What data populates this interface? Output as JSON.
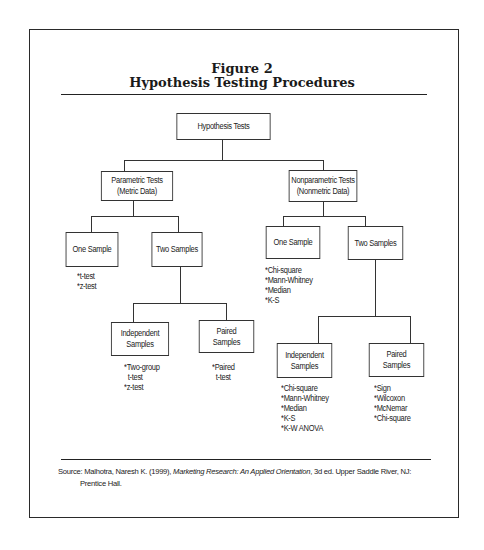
{
  "figure": {
    "label": "Figure 2",
    "title": "Hypothesis Testing Procedures"
  },
  "tree": {
    "root": "Hypothesis Tests",
    "parametric": {
      "label_line1": "Parametric Tests",
      "label_line2": "(Metric Data)",
      "one_sample": {
        "label": "One Sample",
        "tests": [
          "*t-test",
          "*z-test"
        ]
      },
      "two_samples": {
        "label": "Two Samples",
        "independent": {
          "label_line1": "Independent",
          "label_line2": "Samples",
          "tests": [
            "*Two-group",
            "  t-test",
            "*z-test"
          ]
        },
        "paired": {
          "label_line1": "Paired",
          "label_line2": "Samples",
          "tests": [
            "*Paired",
            "  t-test"
          ]
        }
      }
    },
    "nonparametric": {
      "label_line1": "Nonparametric Tests",
      "label_line2": "(Nonmetric Data)",
      "one_sample": {
        "label": "One Sample",
        "tests": [
          "*Chi-square",
          "*Mann-Whitney",
          "*Median",
          "*K-S"
        ]
      },
      "two_samples": {
        "label": "Two Samples",
        "independent": {
          "label_line1": "Independent",
          "label_line2": "Samples",
          "tests": [
            "*Chi-square",
            "*Mann-Whitney",
            "*Median",
            "*K-S",
            "*K-W ANOVA"
          ]
        },
        "paired": {
          "label_line1": "Paired",
          "label_line2": "Samples",
          "tests": [
            "*Sign",
            "*Wilcoxon",
            "*McNemar",
            "*Chi-square"
          ]
        }
      }
    }
  },
  "source": {
    "prefix": "Source: Malhotra, Naresh K. (1999), ",
    "book_title": "Marketing Research: An Applied Orientation",
    "suffix": ", 3d ed. Upper Saddle River, NJ:",
    "continuation": "Prentice Hall."
  }
}
